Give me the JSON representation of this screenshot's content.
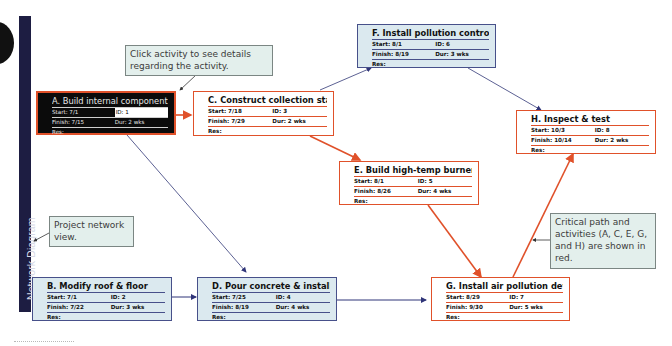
{
  "sidebar": {
    "label": "Network Diagram"
  },
  "colors": {
    "critical": "#e0512a",
    "normal_border": "#47508a",
    "normal_fill": "#dbe9ef",
    "sidebar": "#1d1d42"
  },
  "nodes": {
    "A": {
      "title": "A. Build internal component:",
      "start_label": "Start:",
      "start": "7/1",
      "id_label": "ID:",
      "id": "1",
      "finish_label": "Finish:",
      "finish": "7/15",
      "dur_label": "Dur:",
      "dur": "2 wks",
      "res_label": "Res:",
      "critical": true,
      "selected": true
    },
    "B": {
      "title": "B. Modify roof & floor",
      "start_label": "Start:",
      "start": "7/1",
      "id_label": "ID:",
      "id": "2",
      "finish_label": "Finish:",
      "finish": "7/22",
      "dur_label": "Dur:",
      "dur": "3 wks",
      "res_label": "Res:",
      "critical": false
    },
    "C": {
      "title": "C. Construct collection stack",
      "start_label": "Start:",
      "start": "7/18",
      "id_label": "ID:",
      "id": "3",
      "finish_label": "Finish:",
      "finish": "7/29",
      "dur_label": "Dur:",
      "dur": "2 wks",
      "res_label": "Res:",
      "critical": true
    },
    "D": {
      "title": "D. Pour concrete & install fra",
      "start_label": "Start:",
      "start": "7/25",
      "id_label": "ID:",
      "id": "4",
      "finish_label": "Finish:",
      "finish": "8/19",
      "dur_label": "Dur:",
      "dur": "4 wks",
      "res_label": "Res:",
      "critical": false
    },
    "E": {
      "title": "E. Build high-temp burner",
      "start_label": "Start:",
      "start": "8/1",
      "id_label": "ID:",
      "id": "5",
      "finish_label": "Finish:",
      "finish": "8/26",
      "dur_label": "Dur:",
      "dur": "4 wks",
      "res_label": "Res:",
      "critical": true
    },
    "F": {
      "title": "F. Install pollution control s",
      "start_label": "Start:",
      "start": "8/1",
      "id_label": "ID:",
      "id": "6",
      "finish_label": "Finish:",
      "finish": "8/19",
      "dur_label": "Dur:",
      "dur": "3 wks",
      "res_label": "Res:",
      "critical": false
    },
    "G": {
      "title": "G. Install air pollution device",
      "start_label": "Start:",
      "start": "8/29",
      "id_label": "ID:",
      "id": "7",
      "finish_label": "Finish:",
      "finish": "9/30",
      "dur_label": "Dur:",
      "dur": "5 wks",
      "res_label": "Res:",
      "critical": true
    },
    "H": {
      "title": "H. Inspect & test",
      "start_label": "Start:",
      "start": "10/3",
      "id_label": "ID:",
      "id": "8",
      "finish_label": "Finish:",
      "finish": "10/14",
      "dur_label": "Dur:",
      "dur": "2 wks",
      "res_label": "Res:",
      "critical": true
    }
  },
  "edges": [
    {
      "from": "A",
      "to": "C",
      "critical": true
    },
    {
      "from": "A",
      "to": "D",
      "critical": false
    },
    {
      "from": "B",
      "to": "D",
      "critical": false
    },
    {
      "from": "C",
      "to": "F",
      "critical": false
    },
    {
      "from": "C",
      "to": "E",
      "critical": true
    },
    {
      "from": "F",
      "to": "H",
      "critical": false
    },
    {
      "from": "E",
      "to": "G",
      "critical": true
    },
    {
      "from": "D",
      "to": "G",
      "critical": false
    },
    {
      "from": "G",
      "to": "H",
      "critical": true
    }
  ],
  "callouts": {
    "click_activity": "Click activity to see details regarding the activity.",
    "project_network": "Project network view.",
    "critical_path": "Critical path and activities (A, C, E, G, and H) are shown in red."
  }
}
